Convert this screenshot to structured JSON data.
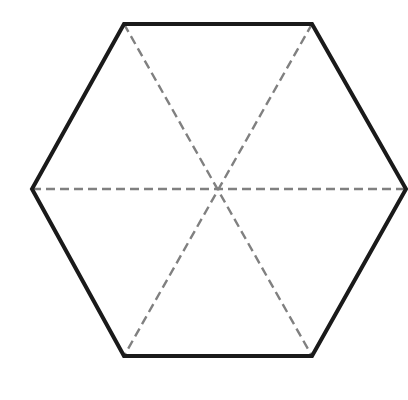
{
  "diagram": {
    "type": "regular-hexagon-with-diagonals",
    "background": "#ffffff",
    "hexagon": {
      "stroke_color": "#1a1a1a",
      "vertices": [
        [
          124,
          24
        ],
        [
          312,
          24
        ],
        [
          406,
          189
        ],
        [
          312,
          356
        ],
        [
          124,
          356
        ],
        [
          32,
          189
        ]
      ]
    },
    "center": [
      217,
      189
    ],
    "diagonals": {
      "style": "dashed",
      "color": "#808080",
      "lines": [
        {
          "from": [
            124,
            24
          ],
          "to": [
            312,
            356
          ]
        },
        {
          "from": [
            312,
            24
          ],
          "to": [
            124,
            356
          ]
        },
        {
          "from": [
            32,
            189
          ],
          "to": [
            406,
            189
          ]
        }
      ]
    }
  }
}
